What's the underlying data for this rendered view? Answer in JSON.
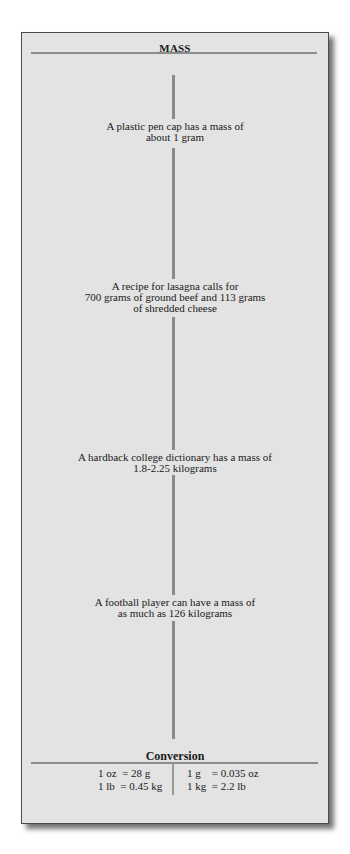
{
  "panel": {
    "title": "MASS",
    "facts": [
      {
        "lines": [
          "A plastic pen cap has a mass of",
          "about 1 gram"
        ]
      },
      {
        "lines": [
          "A recipe for lasagna calls for",
          "700 grams of ground beef and 113 grams",
          "of shredded cheese"
        ]
      },
      {
        "lines": [
          "A hardback college dictionary has a mass of",
          "1.8-2.25 kilograms"
        ]
      },
      {
        "lines": [
          "A football player can have a mass of",
          "as much as 126 kilograms"
        ]
      }
    ],
    "conversion": {
      "title": "Conversion",
      "left": [
        "1 oz  = 28 g",
        "1 lb  = 0.45 kg"
      ],
      "right": [
        "1 g    = 0.035 oz",
        "1 kg  = 2.2 lb"
      ]
    }
  },
  "colors": {
    "panel_bg": "#e3e3e3",
    "rule": "#8c8c8c",
    "border": "#4a4a4a"
  }
}
